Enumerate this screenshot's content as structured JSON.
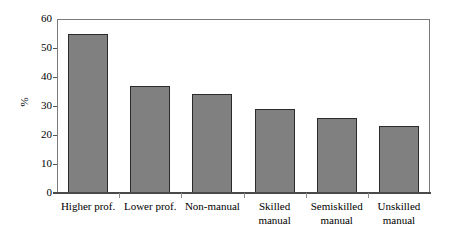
{
  "chart_data": {
    "type": "bar",
    "title": "",
    "subtitle": "",
    "xlabel": "",
    "ylabel": "%",
    "ylim": [
      0,
      60
    ],
    "ytick_values": [
      0,
      10,
      20,
      30,
      40,
      50,
      60
    ],
    "ytick_labels": [
      "0",
      "10",
      "20",
      "30",
      "40",
      "50",
      "60"
    ],
    "grid": false,
    "legend": null,
    "categories": [
      "Higher prof.",
      "Lower prof.",
      "Non-manual",
      "Skilled manual",
      "Semiskilled manual",
      "Unskilled manual"
    ],
    "category_lines": [
      [
        "Higher prof."
      ],
      [
        "Lower prof."
      ],
      [
        "Non-manual"
      ],
      [
        "Skilled",
        "manual"
      ],
      [
        "Semiskilled",
        "manual"
      ],
      [
        "Unskilled",
        "manual"
      ]
    ],
    "values": [
      55,
      37,
      34,
      29,
      26,
      23
    ],
    "bar_color": "#808080",
    "bar_edge_color": "#2b2b2b",
    "frame_color": "#7a7a7a",
    "axis_color": "#4a4a4a",
    "background_color": "#ffffff"
  },
  "axis": {
    "y_title": "%",
    "ticks": [
      {
        "label": "60",
        "value": 60
      },
      {
        "label": "50",
        "value": 50
      },
      {
        "label": "40",
        "value": 40
      },
      {
        "label": "30",
        "value": 30
      },
      {
        "label": "20",
        "value": 20
      },
      {
        "label": "10",
        "value": 10
      },
      {
        "label": "0",
        "value": 0
      }
    ]
  }
}
